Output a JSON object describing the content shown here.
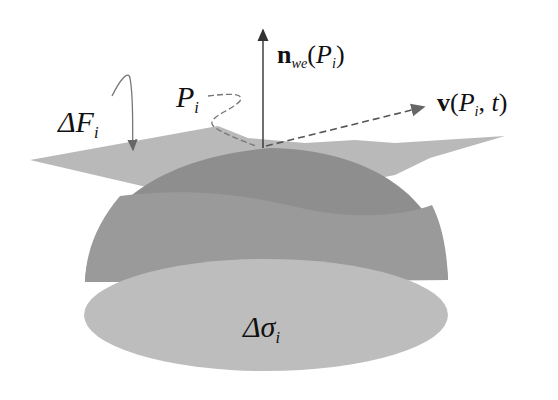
{
  "diagram": {
    "title": "",
    "labels": {
      "delta_f": {
        "prefix": "ΔF",
        "sub": "i"
      },
      "p_i": {
        "prefix": "P",
        "sub": "i"
      },
      "normal": {
        "vec": "n",
        "sub": "we",
        "open": "(",
        "arg": "P",
        "arg_sub": "i",
        "close": ")"
      },
      "velocity": {
        "vec": "v",
        "open": "(",
        "arg": "P",
        "arg_sub": "i",
        "sep": ", ",
        "t": "t",
        "close": ")"
      },
      "delta_sigma": {
        "prefix": "Δσ",
        "sub": "i"
      }
    },
    "shapes": {
      "tangent_plane": {
        "color": "#b9b9b9"
      },
      "dome_upper": {
        "color": "#8c8c8c"
      },
      "dome_band": {
        "color": "#999999"
      },
      "base_ellipse": {
        "color": "#bdbdbd"
      }
    },
    "arrows": {
      "normal_arrow": "vertical normal at P_i",
      "velocity_arrow": "dashed velocity vector",
      "delta_f_pointer": "curved arrow to plane",
      "p_i_pointer": "dashed curved leader to contact point"
    }
  }
}
